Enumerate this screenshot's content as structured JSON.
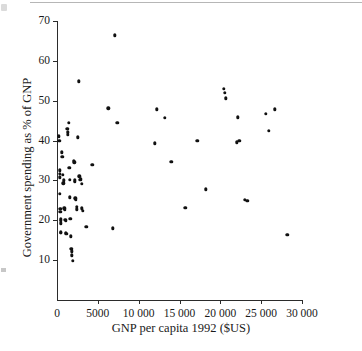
{
  "figure": {
    "background_color": "#ffffff",
    "ink_color": "#111111"
  },
  "chart_data": {
    "type": "scatter",
    "title": "",
    "xlabel": "GNP per capita 1992 ($US)",
    "ylabel": "Government spending as % of GNP",
    "xlim": [
      0,
      30000
    ],
    "ylim": [
      0,
      70
    ],
    "grid": false,
    "legend": null,
    "marker": {
      "shape": "circle",
      "color": "#111111",
      "size": 3.4
    },
    "xticks": [
      0,
      5000,
      10000,
      15000,
      20000,
      25000,
      30000
    ],
    "xticklabels": [
      "0",
      "5000",
      "10 000",
      "15 000",
      "20 000",
      "25 000",
      "30 000"
    ],
    "yticks": [
      10,
      20,
      30,
      40,
      50,
      60,
      70
    ],
    "yticklabels": [
      "10",
      "20",
      "30",
      "40",
      "50",
      "60",
      "70"
    ],
    "n_points": 78,
    "points": [
      [
        250,
        41.1
      ],
      [
        300,
        39.9
      ],
      [
        320,
        32.5
      ],
      [
        340,
        31.6
      ],
      [
        360,
        30.8
      ],
      [
        380,
        26.6
      ],
      [
        400,
        22.9
      ],
      [
        410,
        22.2
      ],
      [
        430,
        20.2
      ],
      [
        450,
        19.8
      ],
      [
        460,
        19.2
      ],
      [
        480,
        17.0
      ],
      [
        500,
        16.8
      ],
      [
        620,
        37.1
      ],
      [
        640,
        35.9
      ],
      [
        700,
        31.4
      ],
      [
        760,
        29.3
      ],
      [
        820,
        30.0
      ],
      [
        900,
        23.0
      ],
      [
        950,
        22.6
      ],
      [
        1000,
        20.1
      ],
      [
        1050,
        19.9
      ],
      [
        1100,
        16.9
      ],
      [
        1150,
        16.6
      ],
      [
        1250,
        43.0
      ],
      [
        1300,
        42.1
      ],
      [
        1350,
        41.5
      ],
      [
        1420,
        44.5
      ],
      [
        1500,
        33.1
      ],
      [
        1560,
        30.1
      ],
      [
        1600,
        25.8
      ],
      [
        1650,
        20.3
      ],
      [
        1700,
        16.0
      ],
      [
        1750,
        12.9
      ],
      [
        1800,
        12.2
      ],
      [
        1850,
        11.2
      ],
      [
        1900,
        9.8
      ],
      [
        2050,
        35.0
      ],
      [
        2100,
        34.5
      ],
      [
        2150,
        30.0
      ],
      [
        2200,
        29.7
      ],
      [
        2250,
        25.5
      ],
      [
        2300,
        25.2
      ],
      [
        2400,
        23.4
      ],
      [
        2450,
        22.8
      ],
      [
        2550,
        40.8
      ],
      [
        2700,
        54.9
      ],
      [
        2750,
        31.0
      ],
      [
        2850,
        30.2
      ],
      [
        3000,
        29.2
      ],
      [
        3050,
        23.0
      ],
      [
        3150,
        22.4
      ],
      [
        3600,
        18.4
      ],
      [
        4300,
        33.9
      ],
      [
        6300,
        48.1
      ],
      [
        6800,
        18.0
      ],
      [
        7100,
        66.4
      ],
      [
        7400,
        44.4
      ],
      [
        12000,
        39.3
      ],
      [
        12200,
        47.8
      ],
      [
        13200,
        45.7
      ],
      [
        14000,
        34.6
      ],
      [
        15700,
        23.1
      ],
      [
        17200,
        40.0
      ],
      [
        18200,
        27.8
      ],
      [
        20400,
        53.0
      ],
      [
        20550,
        52.0
      ],
      [
        20700,
        50.6
      ],
      [
        22000,
        39.6
      ],
      [
        22300,
        40.0
      ],
      [
        22150,
        45.8
      ],
      [
        23000,
        25.1
      ],
      [
        23300,
        24.9
      ],
      [
        25600,
        46.7
      ],
      [
        25900,
        42.5
      ],
      [
        26700,
        47.8
      ],
      [
        28200,
        16.4
      ],
      [
        2950,
        30.4
      ]
    ]
  }
}
